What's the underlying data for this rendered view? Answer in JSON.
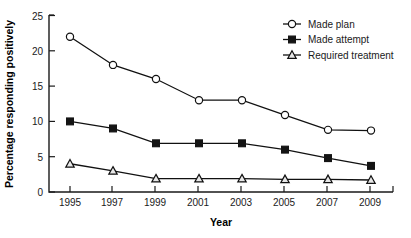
{
  "chart_data": {
    "type": "line",
    "title": "",
    "xlabel": "Year",
    "ylabel": "Percentage responding positively",
    "categories": [
      "1995",
      "1997",
      "1999",
      "2001",
      "2003",
      "2005",
      "2007",
      "2009"
    ],
    "xlim": [
      1994,
      2010
    ],
    "ylim": [
      0,
      25
    ],
    "yticks": [
      "0",
      "5",
      "10",
      "15",
      "20",
      "25"
    ],
    "ytick_values": [
      0,
      5,
      10,
      15,
      20,
      25
    ],
    "grid": false,
    "legend_position": "top-right",
    "series": [
      {
        "name": "Made plan",
        "marker": "open-circle",
        "values": [
          22,
          18,
          16,
          13,
          13,
          10.9,
          8.8,
          8.7
        ]
      },
      {
        "name": "Made attempt",
        "marker": "filled-square",
        "values": [
          10,
          9,
          6.9,
          6.9,
          6.9,
          6,
          4.8,
          3.7
        ]
      },
      {
        "name": "Required treatment",
        "marker": "open-triangle",
        "values": [
          4,
          3,
          1.9,
          1.9,
          1.9,
          1.8,
          1.8,
          1.7
        ]
      }
    ],
    "colors": {
      "line": "#111111",
      "marker_fill_open": "#ffffff",
      "marker_fill_solid": "#141414",
      "axis": "#1a1a1a",
      "background": "#ffffff"
    }
  }
}
